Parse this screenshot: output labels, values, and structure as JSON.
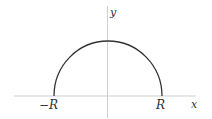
{
  "diagram": {
    "type": "semicircle-contour",
    "axes": {
      "x_label": "x",
      "y_label": "y"
    },
    "points": {
      "left_label": "−R",
      "right_label": "R"
    },
    "colors": {
      "curve": "#333333",
      "axis": "#cccccc",
      "label": "#333333"
    }
  }
}
